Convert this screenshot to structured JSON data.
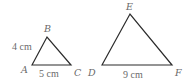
{
  "figure": {
    "stroke_color": "#2b2b2b",
    "label_color": "#6a6a6a",
    "triangles": [
      {
        "name": "ABC",
        "vertices": {
          "A": {
            "label": "A",
            "x": 32,
            "y": 65
          },
          "B": {
            "label": "B",
            "x": 47,
            "y": 37
          },
          "C": {
            "label": "C",
            "x": 71,
            "y": 65
          }
        },
        "measurements": [
          {
            "side": "AB",
            "label": "4 cm"
          },
          {
            "side": "AC",
            "label": "5 cm"
          }
        ]
      },
      {
        "name": "DEF",
        "vertices": {
          "D": {
            "label": "D",
            "x": 102,
            "y": 65
          },
          "E": {
            "label": "E",
            "x": 130,
            "y": 14
          },
          "F": {
            "label": "F",
            "x": 172,
            "y": 65
          }
        },
        "measurements": [
          {
            "side": "DF",
            "label": "9 cm"
          }
        ]
      }
    ]
  }
}
